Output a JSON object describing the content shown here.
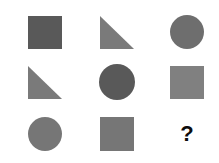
{
  "puzzle": {
    "type": "visual-analogy-matrix",
    "rows": 3,
    "columns": 3,
    "background_color": "#ffffff",
    "colors": {
      "dark_gray": "#595959",
      "mid_gray": "#808080",
      "question_mark": "#0d0d0d"
    },
    "cells": [
      {
        "id": "cell-r1c1",
        "row": 1,
        "column": 1,
        "shape": "square",
        "color": "#595959",
        "label": "dark gray square"
      },
      {
        "id": "cell-r1c2",
        "row": 1,
        "column": 2,
        "shape": "triangle",
        "color": "#7a7a7a",
        "label": "gray right triangle"
      },
      {
        "id": "cell-r1c3",
        "row": 1,
        "column": 3,
        "shape": "circle",
        "color": "#6e6e6e",
        "label": "gray circle"
      },
      {
        "id": "cell-r2c1",
        "row": 2,
        "column": 1,
        "shape": "triangle",
        "color": "#7a7a7a",
        "label": "gray right triangle"
      },
      {
        "id": "cell-r2c2",
        "row": 2,
        "column": 2,
        "shape": "circle",
        "color": "#595959",
        "label": "dark gray circle"
      },
      {
        "id": "cell-r2c3",
        "row": 2,
        "column": 3,
        "shape": "square",
        "color": "#808080",
        "label": "gray square"
      },
      {
        "id": "cell-r3c1",
        "row": 3,
        "column": 1,
        "shape": "circle",
        "color": "#767676",
        "label": "gray circle"
      },
      {
        "id": "cell-r3c2",
        "row": 3,
        "column": 2,
        "shape": "square",
        "color": "#767676",
        "label": "gray square"
      },
      {
        "id": "cell-r3c3",
        "row": 3,
        "column": 3,
        "shape": "question",
        "color": "#0d0d0d",
        "label": "question mark placeholder",
        "text": "?"
      }
    ]
  }
}
